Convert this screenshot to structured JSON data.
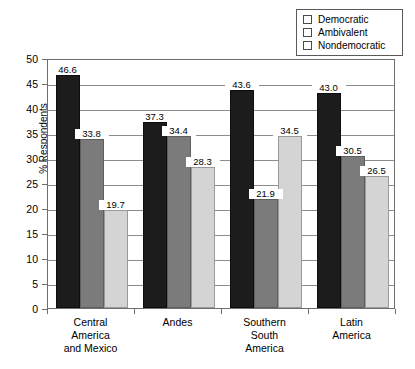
{
  "chart_data": {
    "type": "bar",
    "title": "",
    "subtitle": "",
    "xlabel": "",
    "ylabel": "% Respondents",
    "ylim": [
      0,
      50
    ],
    "ytick_step": 5,
    "yticks": [
      0,
      5,
      10,
      15,
      20,
      25,
      30,
      35,
      40,
      45,
      50
    ],
    "ytick_labels": [
      "0",
      "5",
      "10",
      "15",
      "20",
      "25",
      "30",
      "35",
      "40",
      "45",
      "50"
    ],
    "grid": "horizontal",
    "legend_position": "top-right",
    "categories": [
      "Central\nAmerica\nand Mexico",
      "Andes",
      "Southern\nSouth\nAmerica",
      "Latin\nAmerica"
    ],
    "category_lines": [
      [
        "Central",
        "America",
        "and Mexico"
      ],
      [
        "Andes"
      ],
      [
        "Southern",
        "South",
        "America"
      ],
      [
        "Latin",
        "America"
      ]
    ],
    "series": [
      {
        "name": "Democratic",
        "color": "#1c1c1c",
        "values": [
          46.6,
          37.3,
          43.6,
          43.0
        ],
        "labels": [
          "46.6",
          "37.3",
          "43.6",
          "43.0"
        ]
      },
      {
        "name": "Ambivalent",
        "color": "#7b7b7b",
        "values": [
          33.8,
          34.4,
          21.9,
          30.5
        ],
        "labels": [
          "33.8",
          "34.4",
          "21.9",
          "30.5"
        ]
      },
      {
        "name": "Nondemocratic",
        "color": "#d4d4d4",
        "values": [
          19.7,
          28.3,
          34.5,
          26.5
        ],
        "labels": [
          "19.7",
          "28.3",
          "34.5",
          "26.5"
        ]
      }
    ]
  },
  "legend": {
    "items": [
      {
        "label": "Democratic",
        "color": "#1c1c1c"
      },
      {
        "label": "Ambivalent",
        "color": "#7b7b7b"
      },
      {
        "label": "Nondemocratic",
        "color": "#d4d4d4"
      }
    ]
  },
  "axes": {
    "y_title": "% Respondents"
  }
}
